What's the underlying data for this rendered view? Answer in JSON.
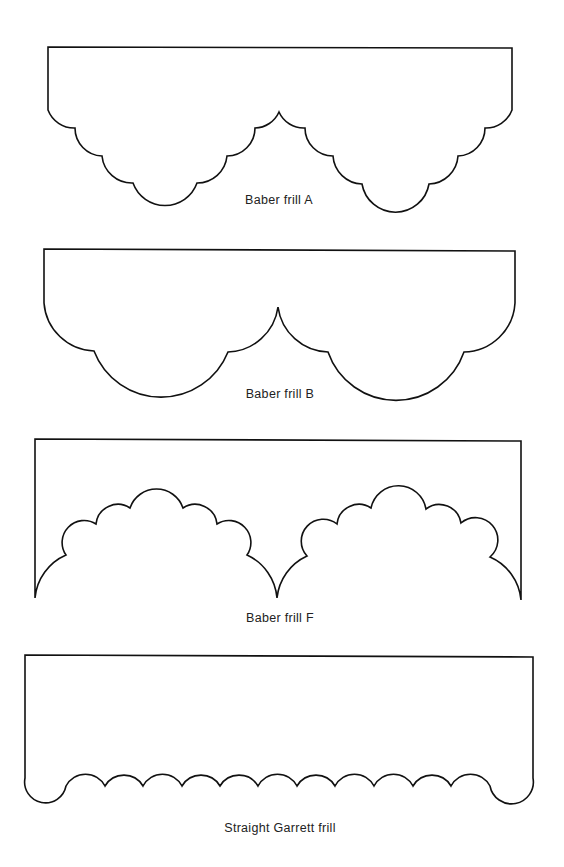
{
  "figure": {
    "background": "#ffffff",
    "stroke_color": "#111111",
    "templates": [
      {
        "id": "baber-frill-a",
        "label": "Baber frill A",
        "scallops_per_side": 4,
        "arches": 2
      },
      {
        "id": "baber-frill-b",
        "label": "Baber frill B",
        "scallops_per_side": 2,
        "arches": 2
      },
      {
        "id": "baber-frill-f",
        "label": "Baber frill F",
        "scallops_per_arch": 7,
        "arches": 2
      },
      {
        "id": "straight-garrett-frill",
        "label": "Straight Garrett frill",
        "scallops": 13
      }
    ]
  }
}
